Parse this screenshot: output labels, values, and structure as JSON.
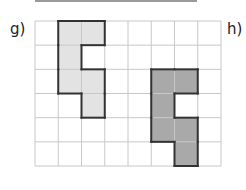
{
  "labels": {
    "left": "g)",
    "right": "h)"
  },
  "grid": {
    "cols": 8,
    "rows": 6,
    "x": 35,
    "y": 21,
    "cell_w": 23.25,
    "cell_h": 24.17,
    "line_color": "#c8c8c8"
  },
  "shapes": [
    {
      "name": "shape-g",
      "fill": "#e3e3e3",
      "stroke": "#333333",
      "cells": [
        [
          1,
          0
        ],
        [
          2,
          0
        ],
        [
          1,
          1
        ],
        [
          1,
          2
        ],
        [
          2,
          2
        ],
        [
          2,
          3
        ]
      ]
    },
    {
      "name": "shape-h",
      "fill": "#a9a9a9",
      "stroke": "#333333",
      "cells": [
        [
          5,
          2
        ],
        [
          6,
          2
        ],
        [
          5,
          3
        ],
        [
          5,
          4
        ],
        [
          6,
          4
        ],
        [
          6,
          5
        ]
      ]
    }
  ]
}
